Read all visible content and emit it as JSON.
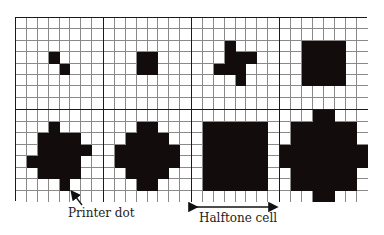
{
  "figure": {
    "grid": {
      "cells_per_row": 4,
      "rows": 2,
      "dots_per_cell_side": 8
    },
    "cells": [
      {
        "id": 1,
        "filled": [
          [
            3,
            3
          ],
          [
            4,
            4
          ]
        ]
      },
      {
        "id": 2,
        "filled": [
          [
            3,
            3
          ],
          [
            3,
            4
          ],
          [
            4,
            3
          ],
          [
            4,
            4
          ]
        ]
      },
      {
        "id": 3,
        "filled": [
          [
            2,
            3
          ],
          [
            3,
            3
          ],
          [
            3,
            4
          ],
          [
            3,
            5
          ],
          [
            4,
            2
          ],
          [
            4,
            3
          ],
          [
            4,
            4
          ],
          [
            5,
            4
          ]
        ]
      },
      {
        "id": 4,
        "filled": [
          [
            2,
            2
          ],
          [
            2,
            3
          ],
          [
            2,
            4
          ],
          [
            2,
            5
          ],
          [
            3,
            2
          ],
          [
            3,
            3
          ],
          [
            3,
            4
          ],
          [
            3,
            5
          ],
          [
            4,
            2
          ],
          [
            4,
            3
          ],
          [
            4,
            4
          ],
          [
            4,
            5
          ],
          [
            5,
            2
          ],
          [
            5,
            3
          ],
          [
            5,
            4
          ],
          [
            5,
            5
          ]
        ]
      },
      {
        "id": 5,
        "filled": [
          [
            1,
            3
          ],
          [
            2,
            2
          ],
          [
            2,
            3
          ],
          [
            2,
            4
          ],
          [
            2,
            5
          ],
          [
            3,
            2
          ],
          [
            3,
            3
          ],
          [
            3,
            4
          ],
          [
            3,
            5
          ],
          [
            3,
            6
          ],
          [
            4,
            1
          ],
          [
            4,
            2
          ],
          [
            4,
            3
          ],
          [
            4,
            4
          ],
          [
            4,
            5
          ],
          [
            5,
            2
          ],
          [
            5,
            3
          ],
          [
            5,
            4
          ],
          [
            5,
            5
          ],
          [
            6,
            4
          ]
        ]
      },
      {
        "id": 6,
        "filled": [
          [
            1,
            3
          ],
          [
            1,
            4
          ],
          [
            2,
            2
          ],
          [
            2,
            3
          ],
          [
            2,
            4
          ],
          [
            2,
            5
          ],
          [
            3,
            1
          ],
          [
            3,
            2
          ],
          [
            3,
            3
          ],
          [
            3,
            4
          ],
          [
            3,
            5
          ],
          [
            3,
            6
          ],
          [
            4,
            1
          ],
          [
            4,
            2
          ],
          [
            4,
            3
          ],
          [
            4,
            4
          ],
          [
            4,
            5
          ],
          [
            4,
            6
          ],
          [
            5,
            2
          ],
          [
            5,
            3
          ],
          [
            5,
            4
          ],
          [
            5,
            5
          ],
          [
            6,
            3
          ],
          [
            6,
            4
          ]
        ]
      },
      {
        "id": 7,
        "filled": [
          [
            1,
            1
          ],
          [
            1,
            2
          ],
          [
            1,
            3
          ],
          [
            1,
            4
          ],
          [
            1,
            5
          ],
          [
            1,
            6
          ],
          [
            2,
            1
          ],
          [
            2,
            2
          ],
          [
            2,
            3
          ],
          [
            2,
            4
          ],
          [
            2,
            5
          ],
          [
            2,
            6
          ],
          [
            3,
            1
          ],
          [
            3,
            2
          ],
          [
            3,
            3
          ],
          [
            3,
            4
          ],
          [
            3,
            5
          ],
          [
            3,
            6
          ],
          [
            4,
            1
          ],
          [
            4,
            2
          ],
          [
            4,
            3
          ],
          [
            4,
            4
          ],
          [
            4,
            5
          ],
          [
            4,
            6
          ],
          [
            5,
            1
          ],
          [
            5,
            2
          ],
          [
            5,
            3
          ],
          [
            5,
            4
          ],
          [
            5,
            5
          ],
          [
            5,
            6
          ],
          [
            6,
            1
          ],
          [
            6,
            2
          ],
          [
            6,
            3
          ],
          [
            6,
            4
          ],
          [
            6,
            5
          ],
          [
            6,
            6
          ]
        ]
      },
      {
        "id": 8,
        "filled": [
          [
            0,
            3
          ],
          [
            0,
            4
          ],
          [
            1,
            1
          ],
          [
            1,
            2
          ],
          [
            1,
            3
          ],
          [
            1,
            4
          ],
          [
            1,
            5
          ],
          [
            1,
            6
          ],
          [
            2,
            1
          ],
          [
            2,
            2
          ],
          [
            2,
            3
          ],
          [
            2,
            4
          ],
          [
            2,
            5
          ],
          [
            2,
            6
          ],
          [
            3,
            0
          ],
          [
            3,
            1
          ],
          [
            3,
            2
          ],
          [
            3,
            3
          ],
          [
            3,
            4
          ],
          [
            3,
            5
          ],
          [
            3,
            6
          ],
          [
            3,
            7
          ],
          [
            4,
            0
          ],
          [
            4,
            1
          ],
          [
            4,
            2
          ],
          [
            4,
            3
          ],
          [
            4,
            4
          ],
          [
            4,
            5
          ],
          [
            4,
            6
          ],
          [
            4,
            7
          ],
          [
            5,
            1
          ],
          [
            5,
            2
          ],
          [
            5,
            3
          ],
          [
            5,
            4
          ],
          [
            5,
            5
          ],
          [
            5,
            6
          ],
          [
            6,
            1
          ],
          [
            6,
            2
          ],
          [
            6,
            3
          ],
          [
            6,
            4
          ],
          [
            6,
            5
          ],
          [
            6,
            6
          ],
          [
            7,
            3
          ],
          [
            7,
            4
          ]
        ]
      }
    ],
    "annotations": {
      "printer_dot": "Printer dot",
      "halftone_cell": "Halftone cell"
    },
    "colors": {
      "ink": "#120c0c",
      "grid_line": "#8a8a8a",
      "cell_border": "#1a1a1a"
    }
  }
}
